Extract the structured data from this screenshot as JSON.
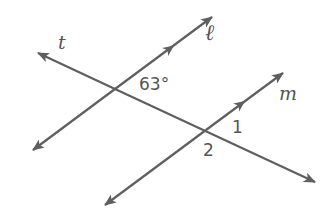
{
  "diagram": {
    "type": "parallel lines cut by a transversal",
    "line_color": "#5f5f5f",
    "text_color": "#555555",
    "lines": [
      {
        "name": "t",
        "label": "t",
        "role": "transversal",
        "from": [
          38,
          53
        ],
        "to": [
          315,
          182
        ]
      },
      {
        "name": "l",
        "label": "ℓ",
        "role": "parallel",
        "from": [
          33,
          150
        ],
        "to": [
          212,
          17
        ],
        "parallel_mark": [
          172,
          47
        ]
      },
      {
        "name": "m",
        "label": "m",
        "role": "parallel",
        "from": [
          105,
          205
        ],
        "to": [
          283,
          73
        ],
        "parallel_mark": [
          243,
          100
        ]
      }
    ],
    "intersections": [
      {
        "lines": [
          "t",
          "l"
        ],
        "point": [
          115,
          89
        ]
      },
      {
        "lines": [
          "t",
          "m"
        ],
        "point": [
          206,
          130
        ]
      }
    ],
    "angle_labels": [
      {
        "text": "63°",
        "position": "top-right of t∩ℓ"
      },
      {
        "text": "1",
        "position": "top-right of t∩m"
      },
      {
        "text": "2",
        "position": "bottom-left of t∩m"
      }
    ]
  },
  "labels": {
    "t": "t",
    "l": "ℓ",
    "m": "m",
    "angle_given": "63°",
    "angle_1": "1",
    "angle_2": "2"
  }
}
